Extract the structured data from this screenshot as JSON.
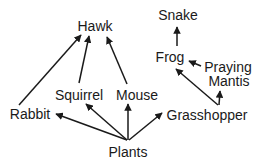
{
  "diagram": {
    "type": "food-web",
    "nodes": {
      "hawk": {
        "label": "Hawk",
        "x": 95,
        "y": 31
      },
      "snake": {
        "label": "Snake",
        "x": 178,
        "y": 20
      },
      "frog": {
        "label": "Frog",
        "x": 170,
        "y": 62
      },
      "praying_mantis": {
        "label1": "Praying",
        "label2": "Mantis",
        "x": 228,
        "y1": 72,
        "y2": 86
      },
      "rabbit": {
        "label": "Rabbit",
        "x": 30,
        "y": 118
      },
      "squirrel": {
        "label": "Squirrel",
        "x": 79,
        "y": 100
      },
      "mouse": {
        "label": "Mouse",
        "x": 137,
        "y": 100
      },
      "plants": {
        "label": "Plants",
        "x": 128,
        "y": 157
      },
      "grasshopper": {
        "label": "Grasshopper",
        "x": 207,
        "y": 120
      }
    },
    "edges": [
      {
        "from": "rabbit",
        "to": "hawk"
      },
      {
        "from": "squirrel",
        "to": "hawk"
      },
      {
        "from": "mouse",
        "to": "hawk"
      },
      {
        "from": "plants",
        "to": "rabbit"
      },
      {
        "from": "plants",
        "to": "squirrel"
      },
      {
        "from": "plants",
        "to": "mouse"
      },
      {
        "from": "plants",
        "to": "grasshopper"
      },
      {
        "from": "frog",
        "to": "snake"
      },
      {
        "from": "praying_mantis",
        "to": "frog"
      },
      {
        "from": "grasshopper",
        "to": "frog"
      },
      {
        "from": "grasshopper",
        "to": "praying_mantis"
      }
    ]
  }
}
